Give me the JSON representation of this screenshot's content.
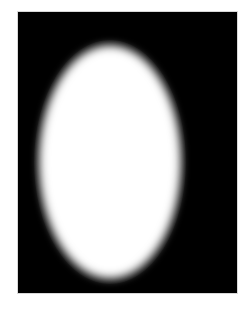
{
  "image": {
    "description": "White blurred vertical ellipse on a black rectangular background",
    "background_color": "#000000",
    "shape_color": "#ffffff",
    "page_color": "#ffffff"
  },
  "captions": {
    "top": "",
    "bottom": ""
  }
}
